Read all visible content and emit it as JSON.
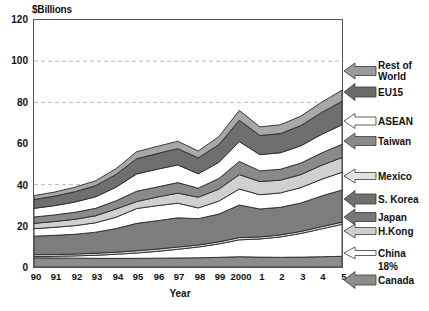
{
  "chart_data": {
    "type": "area",
    "stacked": true,
    "title": "",
    "ylabel": "$Billions",
    "xlabel": "Year",
    "ylim": [
      0,
      120
    ],
    "yticks": [
      0,
      20,
      40,
      60,
      80,
      100,
      120
    ],
    "grid": true,
    "gridlines_at": [
      40,
      80,
      100
    ],
    "legend_position": "right-callouts",
    "x": [
      "90",
      "91",
      "92",
      "93",
      "94",
      "95",
      "96",
      "97",
      "98",
      "99",
      "2000",
      "1",
      "2",
      "3",
      "4",
      "5"
    ],
    "series": [
      {
        "name": "Canada",
        "color": "#8c8c8c",
        "values": [
          4.5,
          4.4,
          4.3,
          4.2,
          4.2,
          4.2,
          4.3,
          4.4,
          4.5,
          4.7,
          5.0,
          4.8,
          4.7,
          4.8,
          5.0,
          5.2
        ]
      },
      {
        "name": "China",
        "color": "#ffffff",
        "values": [
          0.6,
          0.8,
          1.1,
          1.5,
          2.0,
          2.6,
          3.3,
          4.2,
          5.2,
          6.5,
          8.2,
          8.8,
          9.9,
          11.5,
          13.5,
          15.5
        ]
      },
      {
        "name": "H.Kong",
        "color": "#d9d9d9",
        "values": [
          0.9,
          0.9,
          0.9,
          1.0,
          1.0,
          1.1,
          1.1,
          1.1,
          1.0,
          1.0,
          1.1,
          1.0,
          1.0,
          1.0,
          1.1,
          1.1
        ]
      },
      {
        "name": "Japan",
        "color": "#7d7d7d",
        "values": [
          9.0,
          9.3,
          9.6,
          10.2,
          11.5,
          13.3,
          13.8,
          14.2,
          12.8,
          13.5,
          15.8,
          13.6,
          13.4,
          13.8,
          14.9,
          15.6
        ]
      },
      {
        "name": "S. Korea",
        "color": "#ffffff",
        "values": [
          3.6,
          3.9,
          4.2,
          4.6,
          5.5,
          7.2,
          7.3,
          7.1,
          5.2,
          6.3,
          7.8,
          6.9,
          7.0,
          7.5,
          8.1,
          8.6
        ]
      },
      {
        "name": "Mexico",
        "color": "#d0d0d0",
        "values": [
          2.6,
          2.8,
          3.1,
          3.4,
          4.0,
          3.4,
          4.2,
          4.9,
          5.2,
          5.8,
          7.0,
          6.4,
          6.2,
          6.3,
          6.8,
          7.2
        ]
      },
      {
        "name": "Taiwan",
        "color": "#8a8a8a",
        "values": [
          3.1,
          3.2,
          3.4,
          3.6,
          4.0,
          5.0,
          4.9,
          5.1,
          4.4,
          5.2,
          6.4,
          5.2,
          5.3,
          5.6,
          6.0,
          6.4
        ]
      },
      {
        "name": "ASEAN",
        "color": "#ffffff",
        "values": [
          4.2,
          4.5,
          5.0,
          5.6,
          6.6,
          8.4,
          8.6,
          8.6,
          7.0,
          7.8,
          9.6,
          7.9,
          8.0,
          8.4,
          9.0,
          9.5
        ]
      },
      {
        "name": "EU15",
        "color": "#6f6f6f",
        "values": [
          4.3,
          4.6,
          5.0,
          5.4,
          6.2,
          7.4,
          7.6,
          7.9,
          7.7,
          8.6,
          10.4,
          9.3,
          9.3,
          9.8,
          10.6,
          11.4
        ]
      },
      {
        "name": "Rest of World",
        "color": "#a8a8a8",
        "values": [
          1.9,
          2.0,
          2.2,
          2.4,
          2.8,
          3.4,
          3.5,
          3.6,
          3.4,
          3.9,
          4.8,
          4.2,
          4.3,
          4.6,
          5.0,
          5.4
        ]
      }
    ],
    "annotations": [
      {
        "text": "18%",
        "refers_to": "China"
      }
    ]
  },
  "axes": {
    "y_title": "$Billions",
    "x_title": "Year",
    "y_tick_labels": [
      "120",
      "100",
      "80",
      "60",
      "40",
      "20",
      "0"
    ],
    "x_tick_labels": [
      "90",
      "91",
      "92",
      "93",
      "94",
      "95",
      "96",
      "97",
      "98",
      "99",
      "2000",
      "1",
      "2",
      "3",
      "4",
      "5"
    ]
  },
  "callouts": [
    {
      "label": "Rest of\nWorld",
      "arrow_color": "#9a9a9a"
    },
    {
      "label": "EU15",
      "arrow_color": "#6b6b6b"
    },
    {
      "label": "ASEAN",
      "arrow_color": "#ffffff"
    },
    {
      "label": "Taiwan",
      "arrow_color": "#8a8a8a"
    },
    {
      "label": "Mexico",
      "arrow_color": "#e2e2e2"
    },
    {
      "label": "S. Korea",
      "arrow_color": "#6f6f6f"
    },
    {
      "label": "Japan",
      "arrow_color": "#777777"
    },
    {
      "label": "H.Kong",
      "arrow_color": "#cfcfcf"
    },
    {
      "label": "China",
      "arrow_color": "#ffffff"
    },
    {
      "label": "Canada",
      "arrow_color": "#8c8c8c"
    }
  ],
  "china_percent": "18%",
  "colors": {
    "axis": "#555555",
    "grid": "#b9b9b9",
    "text": "#111111",
    "plot_background": "#ffffff"
  }
}
